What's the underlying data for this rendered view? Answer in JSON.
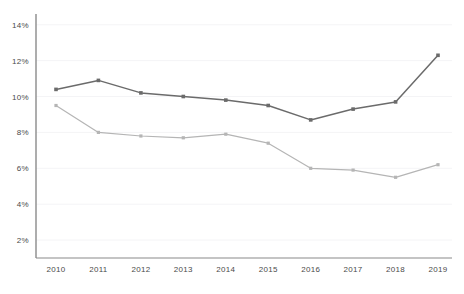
{
  "chart_data": {
    "type": "line",
    "title": "",
    "subtitle": "",
    "xlabel": "",
    "ylabel": "",
    "categories": [
      "2010",
      "2011",
      "2012",
      "2013",
      "2014",
      "2015",
      "2016",
      "2017",
      "2018",
      "2019"
    ],
    "series": [
      {
        "name": "upper-series",
        "color": "#6b6b6b",
        "values": [
          10.4,
          10.9,
          10.2,
          10.0,
          9.8,
          9.5,
          8.7,
          9.3,
          9.7,
          12.3
        ]
      },
      {
        "name": "lower-series",
        "color": "#b5b5b5",
        "values": [
          9.5,
          8.0,
          7.8,
          7.7,
          7.9,
          7.4,
          6.0,
          5.9,
          5.5,
          6.2
        ]
      }
    ],
    "ylim": [
      1.0,
      14.6
    ],
    "y_ticks": [
      2,
      4,
      6,
      8,
      10,
      12,
      14
    ],
    "y_tick_labels": [
      "2%",
      "4%",
      "6%",
      "8%",
      "10%",
      "12%",
      "14%"
    ],
    "x_tick_labels": [
      "2010",
      "2011",
      "2012",
      "2013",
      "2014",
      "2015",
      "2016",
      "2017",
      "2018",
      "2019"
    ],
    "grid": true,
    "grid_color": "#f4f4f6",
    "axis_color": "#8a8a8a",
    "legend_position": "none",
    "marker": "square",
    "top_note": "",
    "plot_area": {
      "left": 36,
      "top": 14,
      "right": 452,
      "bottom": 258
    }
  }
}
